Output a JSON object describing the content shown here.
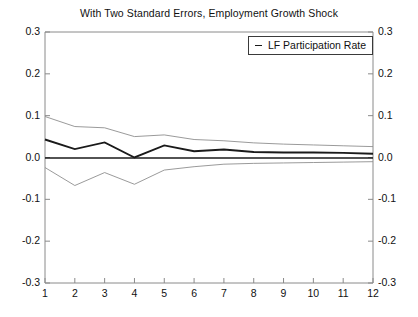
{
  "chart_data": {
    "type": "line",
    "title": "With Two Standard Errors, Employment Growth Shock",
    "xlabel": "",
    "ylabel": "",
    "x": [
      1,
      2,
      3,
      4,
      5,
      6,
      7,
      8,
      9,
      10,
      11,
      12
    ],
    "xlim": [
      1,
      12
    ],
    "ylim": [
      -0.3,
      0.3
    ],
    "yticks": [
      0.3,
      0.2,
      0.1,
      0.0,
      -0.1,
      -0.2,
      -0.3
    ],
    "ytick_labels": [
      "0.3",
      "0.2",
      "0.1",
      "0.0",
      "-0.1",
      "-0.2",
      "-0.3"
    ],
    "xticks": [
      1,
      2,
      3,
      4,
      5,
      6,
      7,
      8,
      9,
      10,
      11,
      12
    ],
    "xtick_labels": [
      "1",
      "2",
      "3",
      "4",
      "5",
      "6",
      "7",
      "8",
      "9",
      "10",
      "11",
      "12"
    ],
    "grid": false,
    "zero_line": true,
    "mirrored_y_axis": true,
    "legend": {
      "position": "top-right",
      "entries": [
        {
          "label": "LF Participation Rate",
          "color": "#1a1a1a",
          "style": "solid"
        }
      ]
    },
    "series": [
      {
        "name": "LF Participation Rate",
        "role": "point-estimate",
        "color": "#1a1a1a",
        "width": 1.9,
        "values": [
          0.043,
          0.02,
          0.036,
          0.0,
          0.029,
          0.015,
          0.019,
          0.013,
          0.012,
          0.012,
          0.011,
          0.009
        ]
      },
      {
        "name": "Upper Two Standard Errors",
        "role": "upper-band",
        "color": "#8f8f8f",
        "width": 0.9,
        "values": [
          0.098,
          0.074,
          0.071,
          0.05,
          0.054,
          0.043,
          0.04,
          0.035,
          0.032,
          0.03,
          0.028,
          0.026
        ]
      },
      {
        "name": "Lower Two Standard Errors",
        "role": "lower-band",
        "color": "#8f8f8f",
        "width": 0.9,
        "values": [
          -0.024,
          -0.067,
          -0.036,
          -0.064,
          -0.03,
          -0.022,
          -0.016,
          -0.014,
          -0.013,
          -0.012,
          -0.011,
          -0.01
        ]
      }
    ]
  },
  "legend": {
    "series_label": "LF Participation Rate"
  },
  "axes": {
    "left_labels": [
      "0.3",
      "0.2",
      "0.1",
      "0.0",
      "-0.1",
      "-0.2",
      "-0.3"
    ],
    "right_labels": [
      "0.3",
      "0.2",
      "0.1",
      "0.0",
      "-0.1",
      "-0.2",
      "-0.3"
    ],
    "bottom_labels": [
      "1",
      "2",
      "3",
      "4",
      "5",
      "6",
      "7",
      "8",
      "9",
      "10",
      "11",
      "12"
    ]
  }
}
